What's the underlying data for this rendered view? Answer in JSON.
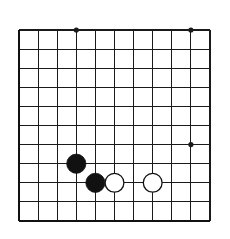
{
  "figure": {
    "kind": "go-board-diagram",
    "background_color": "#ffffff",
    "line_color": "#1a1a1a",
    "edge_color": "#111111",
    "black_stone_color": "#111111",
    "white_stone_color": "#ffffff",
    "white_stone_border_color": "#111111"
  },
  "board": {
    "columns": 11,
    "rows": 11,
    "origin_x": 19,
    "origin_y": 30,
    "cell_size": 19.1,
    "line_width": 1.1,
    "edge_line_width": 2.4,
    "edges": [
      "left",
      "bottom"
    ],
    "star_point_radius": 2.6
  },
  "star_points": [
    {
      "name": "star-point-top-left",
      "col": 3,
      "row": 0
    },
    {
      "name": "star-point-top-right",
      "col": 9,
      "row": 0
    },
    {
      "name": "star-point-right",
      "col": 9,
      "row": 6
    }
  ],
  "stones": [
    {
      "name": "black-stone-1",
      "color": "black",
      "col": 3,
      "row": 7,
      "radius": 9.6
    },
    {
      "name": "black-stone-2",
      "color": "black",
      "col": 4,
      "row": 8,
      "radius": 9.6
    },
    {
      "name": "white-stone-1",
      "color": "white",
      "col": 5,
      "row": 8,
      "radius": 9.4
    },
    {
      "name": "white-stone-2",
      "color": "white",
      "col": 7,
      "row": 8,
      "radius": 9.4
    }
  ]
}
